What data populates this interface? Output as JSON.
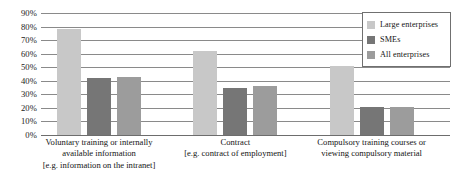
{
  "chart_data": {
    "type": "bar",
    "title": "",
    "subtitle": "",
    "xlabel": "",
    "ylabel": "",
    "ylim": [
      0,
      90
    ],
    "ytick_labels": [
      "90%",
      "80%",
      "70%",
      "60%",
      "50%",
      "40%",
      "30%",
      "20%",
      "10%",
      "0%"
    ],
    "ytick_values": [
      90,
      80,
      70,
      60,
      50,
      40,
      30,
      20,
      10,
      0
    ],
    "grid": "horizontal",
    "legend_position": "top-right",
    "categories": [
      "Voluntary training or internally available information [e.g. information on the intranet]",
      "Contract [e.g. contract of employment]",
      "Compulsory training courses or viewing compulsory material"
    ],
    "category_lines": [
      [
        "Voluntary training or internally",
        "available information",
        "[e.g. information on the intranet]"
      ],
      [
        "Contract",
        "[e.g. contract of employment]"
      ],
      [
        "Compulsory training courses or",
        "viewing compulsory material"
      ]
    ],
    "series": [
      {
        "name": "Large enterprises",
        "color": "#c8c8c8",
        "values": [
          78,
          62,
          51
        ]
      },
      {
        "name": "SMEs",
        "color": "#767676",
        "values": [
          42,
          35,
          21
        ]
      },
      {
        "name": "All enterprises",
        "color": "#9c9c9c",
        "values": [
          43,
          36,
          21
        ]
      }
    ]
  },
  "legend": {
    "items": [
      {
        "label": "Large enterprises"
      },
      {
        "label": "SMEs"
      },
      {
        "label": "All enterprises"
      }
    ]
  }
}
